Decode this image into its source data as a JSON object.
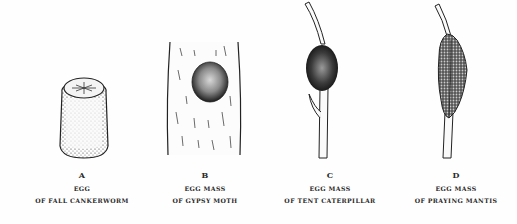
{
  "figures": [
    {
      "letter": "A",
      "line1": "EGG",
      "line2": "OF FALL CANKERWORM"
    },
    {
      "letter": "B",
      "line1": "EGG MASS",
      "line2": "OF GYPSY MOTH"
    },
    {
      "letter": "C",
      "line1": "EGG MASS",
      "line2": "OF TENT CATERPILLAR"
    },
    {
      "letter": "D",
      "line1": "EGG MASS",
      "line2": "OF PRAYING MANTIS"
    }
  ]
}
